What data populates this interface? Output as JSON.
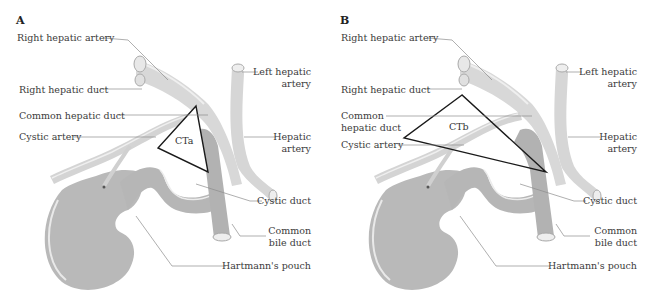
{
  "panels": [
    {
      "letter": "A",
      "triangle_label": "CTa",
      "labels": {
        "right_hepatic_artery": "Right hepatic artery",
        "right_hepatic_duct": "Right hepatic duct",
        "common_hepatic_duct": "Common hepatic duct",
        "cystic_artery": "Cystic artery",
        "left_hepatic_artery_1": "Left hepatic",
        "left_hepatic_artery_2": "artery",
        "hepatic_artery_1": "Hepatic",
        "hepatic_artery_2": "artery",
        "cystic_duct": "Cystic duct",
        "common_bile_duct_1": "Common",
        "common_bile_duct_2": "bile duct",
        "hartmanns_pouch": "Hartmann's pouch"
      }
    },
    {
      "letter": "B",
      "triangle_label": "CTb",
      "labels": {
        "right_hepatic_artery": "Right hepatic artery",
        "right_hepatic_duct": "Right hepatic duct",
        "common_hepatic_duct_1": "Common",
        "common_hepatic_duct_2": "hepatic duct",
        "cystic_artery": "Cystic artery",
        "left_hepatic_artery_1": "Left hepatic",
        "left_hepatic_artery_2": "artery",
        "hepatic_artery_1": "Hepatic",
        "hepatic_artery_2": "artery",
        "cystic_duct": "Cystic duct",
        "common_bile_duct_1": "Common",
        "common_bile_duct_2": "bile duct",
        "hartmanns_pouch": "Hartmann's pouch"
      }
    }
  ],
  "colors": {
    "artery_fill": "#d6d6d6",
    "duct_fill": "#b4b4b4",
    "gallbladder_fill": "#b8b8b8",
    "highlight": "#f0f0f0",
    "leader_line": "#8a8a8a",
    "triangle_stroke": "#1a1a1a"
  }
}
